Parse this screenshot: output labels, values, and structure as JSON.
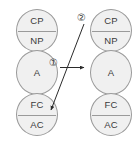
{
  "diagram": {
    "type": "ego-state transaction diagram",
    "colors": {
      "ellipse_fill": "#f0f0f0",
      "ellipse_stroke": "#9a9a9a",
      "text": "#3b3b3b",
      "arrow": "#2b2b2b",
      "background": "#ffffff"
    },
    "columns": [
      {
        "id": "left",
        "role": "person-a",
        "states": [
          {
            "name": "parent",
            "split": true,
            "top_label": "CP",
            "bottom_label": "NP"
          },
          {
            "name": "adult",
            "split": false,
            "label": "A"
          },
          {
            "name": "child",
            "split": true,
            "top_label": "FC",
            "bottom_label": "AC"
          }
        ]
      },
      {
        "id": "right",
        "role": "person-b",
        "states": [
          {
            "name": "parent",
            "split": true,
            "top_label": "CP",
            "bottom_label": "NP"
          },
          {
            "name": "adult",
            "split": false,
            "label": "A"
          },
          {
            "name": "child",
            "split": true,
            "top_label": "FC",
            "bottom_label": "AC"
          }
        ]
      }
    ],
    "arrows": [
      {
        "id": "arrow-1",
        "label": "①",
        "label_plain": "1",
        "direction": "left-to-right",
        "from": "left.adult",
        "to": "right.adult",
        "style": "straight-horizontal"
      },
      {
        "id": "arrow-2",
        "label": "②",
        "label_plain": "2",
        "direction": "right-to-left-downward",
        "from": "right.parent",
        "to": "left.child",
        "style": "straight-diagonal"
      }
    ]
  }
}
